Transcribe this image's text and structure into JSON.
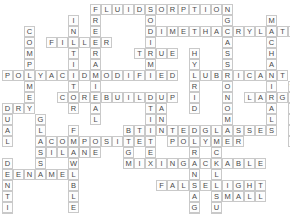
{
  "puzzle": {
    "title": "Dental Materials Crossword",
    "grid": {
      "cols": 26,
      "rows": 19,
      "cell_px": 11,
      "origin_x": 2,
      "origin_y": 4
    },
    "colors": {
      "cell_fill": "#fdfdfd",
      "cell_border": "#c9c9c9",
      "letter": "#4a4a4a",
      "background": "#ffffff"
    },
    "entries": [
      {
        "answer": "FLUID",
        "direction": "across",
        "row": 0,
        "col": 8
      },
      {
        "answer": "SORPTION",
        "direction": "across",
        "row": 0,
        "col": 13
      },
      {
        "answer": "FILLER",
        "direction": "across",
        "row": 3,
        "col": 4
      },
      {
        "answer": "DIMETHACRYLATE",
        "direction": "across",
        "row": 2,
        "col": 13
      },
      {
        "answer": "TRUE",
        "direction": "across",
        "row": 4,
        "col": 12
      },
      {
        "answer": "POLYACID",
        "direction": "across",
        "row": 6,
        "col": 0
      },
      {
        "answer": "MODIFIED",
        "direction": "across",
        "row": 6,
        "col": 8
      },
      {
        "answer": "LUBRICANT",
        "direction": "across",
        "row": 6,
        "col": 17
      },
      {
        "answer": "DRY",
        "direction": "across",
        "row": 9,
        "col": 0
      },
      {
        "answer": "COREBUILDUP",
        "direction": "across",
        "row": 8,
        "col": 5
      },
      {
        "answer": "LARGE",
        "direction": "across",
        "row": 8,
        "col": 22
      },
      {
        "answer": "TINTEDGLASSES",
        "direction": "across",
        "row": 11,
        "col": 12
      },
      {
        "answer": "COMPOSITE",
        "direction": "across",
        "row": 12,
        "col": 4
      },
      {
        "answer": "POLYMER",
        "direction": "across",
        "row": 12,
        "col": 15
      },
      {
        "answer": "SILANE",
        "direction": "across",
        "row": 13,
        "col": 3
      },
      {
        "answer": "ENAMEL",
        "direction": "across",
        "row": 15,
        "col": 1
      },
      {
        "answer": "MIXING",
        "direction": "across",
        "row": 14,
        "col": 11
      },
      {
        "answer": "PACKABLE",
        "direction": "across",
        "row": 14,
        "col": 16
      },
      {
        "answer": "LIGHT",
        "direction": "across",
        "row": 16,
        "col": 19
      },
      {
        "answer": "FALSE",
        "direction": "across",
        "row": 16,
        "col": 14
      },
      {
        "answer": "SMALL",
        "direction": "across",
        "row": 17,
        "col": 19
      },
      {
        "answer": "COMPOMER",
        "direction": "down",
        "row": 2,
        "col": 2
      },
      {
        "answer": "INITIATOR",
        "direction": "down",
        "row": 1,
        "col": 6
      },
      {
        "answer": "FREERADICAL",
        "direction": "down",
        "row": 0,
        "col": 8
      },
      {
        "answer": "DUAL",
        "direction": "down",
        "row": 9,
        "col": 0
      },
      {
        "answer": "SODIUM",
        "direction": "down",
        "row": 0,
        "col": 13
      },
      {
        "answer": "GLASS",
        "direction": "down",
        "row": 1,
        "col": 20
      },
      {
        "answer": "HYBRID",
        "direction": "down",
        "row": 4,
        "col": 17
      },
      {
        "answer": "MECHANICAL",
        "direction": "down",
        "row": 1,
        "col": 24
      },
      {
        "answer": "MONOMER",
        "direction": "down",
        "row": 6,
        "col": 20
      },
      {
        "answer": "WEEKLY",
        "direction": "down",
        "row": 7,
        "col": 26
      },
      {
        "answer": "GLASS",
        "direction": "down",
        "row": 10,
        "col": 3
      },
      {
        "answer": "FLOWABLE",
        "direction": "down",
        "row": 11,
        "col": 6
      },
      {
        "answer": "BIG",
        "direction": "down",
        "row": 11,
        "col": 11
      },
      {
        "answer": "TINTED",
        "direction": "down",
        "row": 9,
        "col": 13
      },
      {
        "answer": "DENTIN",
        "direction": "down",
        "row": 14,
        "col": 0
      },
      {
        "answer": "SHRINKAGE",
        "direction": "down",
        "row": 11,
        "col": 17
      },
      {
        "answer": "CALCIUM",
        "direction": "down",
        "row": 13,
        "col": 19
      },
      {
        "answer": "SER",
        "direction": "down",
        "row": 11,
        "col": 19
      },
      {
        "answer": "ANT",
        "direction": "down",
        "row": 9,
        "col": 14
      },
      {
        "answer": "LY",
        "direction": "down",
        "row": 11,
        "col": 26
      }
    ]
  }
}
